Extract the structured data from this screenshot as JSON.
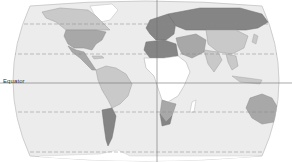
{
  "map": {
    "type": "world-choropleth",
    "projection": "robinson-like",
    "colormode": "grayscale",
    "labels": {
      "equator": "Equator"
    },
    "reference_lines": [
      {
        "name": "equator",
        "style": "solid"
      },
      {
        "name": "tropic-of-cancer",
        "style": "dashed"
      },
      {
        "name": "tropic-of-capricorn",
        "style": "dashed"
      },
      {
        "name": "arctic-circle",
        "style": "dashed"
      },
      {
        "name": "antarctic-circle",
        "style": "dashed"
      },
      {
        "name": "prime-meridian",
        "style": "solid"
      }
    ],
    "colors": {
      "ocean": "#ececec",
      "outline": "#bdbdbd",
      "shade_white": "#ffffff",
      "shade_light": "#c9c9c9",
      "shade_medium": "#a8a8a8",
      "shade_dark": "#858585",
      "lines": "#7a7a7a"
    },
    "regions": [
      {
        "name": "canada",
        "shade": "light"
      },
      {
        "name": "usa",
        "shade": "medium"
      },
      {
        "name": "mexico-central-america",
        "shade": "medium"
      },
      {
        "name": "south-america-north",
        "shade": "light"
      },
      {
        "name": "argentina-chile",
        "shade": "dark"
      },
      {
        "name": "greenland",
        "shade": "white"
      },
      {
        "name": "europe",
        "shade": "dark"
      },
      {
        "name": "russia",
        "shade": "dark"
      },
      {
        "name": "north-africa",
        "shade": "dark"
      },
      {
        "name": "sub-saharan-africa",
        "shade": "white"
      },
      {
        "name": "southern-africa",
        "shade": "medium"
      },
      {
        "name": "middle-east",
        "shade": "medium"
      },
      {
        "name": "china",
        "shade": "light"
      },
      {
        "name": "india",
        "shade": "light"
      },
      {
        "name": "southeast-asia",
        "shade": "light"
      },
      {
        "name": "australia",
        "shade": "medium"
      }
    ]
  }
}
